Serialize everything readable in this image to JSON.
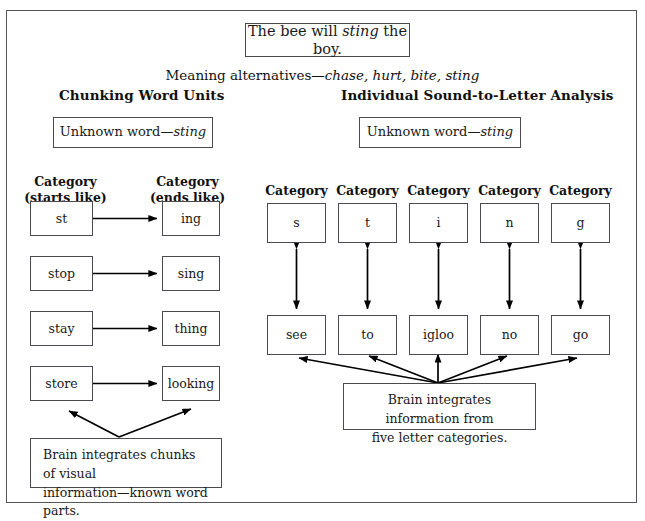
{
  "figure": {
    "sentence_box": {
      "prefix": "The bee will ",
      "italic": "sting",
      "suffix": " the boy."
    },
    "meaning_alternatives": {
      "label": "Meaning alternatives—",
      "italic": "chase, hurt, bite, sting"
    },
    "left_panel": {
      "heading": "Chunking Word Units",
      "unknown_word": {
        "label": "Unknown word—",
        "italic": "sting"
      },
      "category_labels": [
        {
          "line1": "Category",
          "line2": "(starts like)"
        },
        {
          "line1": "Category",
          "line2": "(ends like)"
        }
      ],
      "pairs": [
        {
          "start": "st",
          "end": "ing"
        },
        {
          "start": "stop",
          "end": "sing"
        },
        {
          "start": "stay",
          "end": "thing"
        },
        {
          "start": "store",
          "end": "looking"
        }
      ],
      "caption": {
        "line1": "Brain integrates chunks of visual",
        "line2": "information—known word parts."
      }
    },
    "right_panel": {
      "heading": "Individual Sound-to-Letter Analysis",
      "unknown_word": {
        "label": "Unknown word—",
        "italic": "sting"
      },
      "category_label": "Category",
      "columns": [
        {
          "letter": "s",
          "word": "see"
        },
        {
          "letter": "t",
          "word": "to"
        },
        {
          "letter": "i",
          "word": "igloo"
        },
        {
          "letter": "n",
          "word": "no"
        },
        {
          "letter": "g",
          "word": "go"
        }
      ],
      "caption": {
        "line1": "Brain integrates information from",
        "line2": "five letter categories."
      }
    },
    "colors": {
      "border": "#4a4a50",
      "outer_border": "#55555a",
      "text": "#1a1a1a",
      "background": "#ffffff",
      "arrow": "#000000"
    }
  }
}
